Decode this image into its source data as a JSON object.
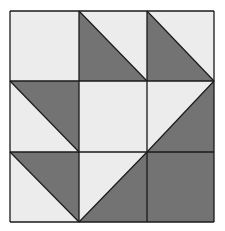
{
  "diagram": {
    "type": "quilt-block",
    "grid": {
      "rows": 3,
      "cols": 3
    },
    "colors": {
      "light": "#ececec",
      "dark": "#737373",
      "line": "#1a1a1a",
      "background": "#ffffff"
    },
    "bounds": {
      "x_lines": [
        10,
        79,
        147,
        214
      ],
      "y_lines": [
        11,
        81,
        152,
        222
      ]
    },
    "cells": [
      {
        "row": 0,
        "col": 0,
        "fill": "light"
      },
      {
        "row": 0,
        "col": 1,
        "fill": "half",
        "dark_corner": "bottom-left",
        "diagonal": "tl-br"
      },
      {
        "row": 0,
        "col": 2,
        "fill": "half",
        "dark_corner": "bottom-left",
        "diagonal": "tl-br"
      },
      {
        "row": 1,
        "col": 0,
        "fill": "half",
        "dark_corner": "top-right",
        "diagonal": "tl-br"
      },
      {
        "row": 1,
        "col": 1,
        "fill": "light"
      },
      {
        "row": 1,
        "col": 2,
        "fill": "half",
        "dark_corner": "bottom-right",
        "diagonal": "tr-bl"
      },
      {
        "row": 2,
        "col": 0,
        "fill": "half",
        "dark_corner": "top-right",
        "diagonal": "tl-br"
      },
      {
        "row": 2,
        "col": 1,
        "fill": "half",
        "dark_corner": "bottom-right",
        "diagonal": "tr-bl"
      },
      {
        "row": 2,
        "col": 2,
        "fill": "dark"
      }
    ]
  }
}
